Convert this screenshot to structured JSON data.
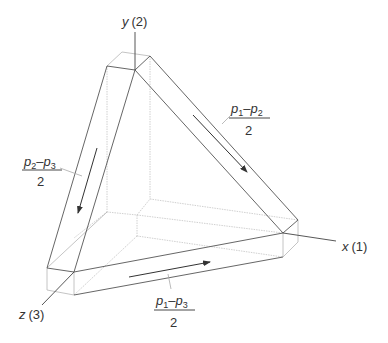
{
  "diagram": {
    "type": "stress-space prism (principal shear stresses)",
    "colors": {
      "edge_dark": "#555555",
      "edge_light": "#b8b8b8",
      "edge_hidden": "#c8c8c8",
      "text": "#333333",
      "background": "#ffffff"
    },
    "axes": [
      {
        "id": "y",
        "letter": "y",
        "index": "(2)"
      },
      {
        "id": "x",
        "letter": "x",
        "index": "(1)"
      },
      {
        "id": "z",
        "letter": "z",
        "index": "(3)"
      }
    ],
    "shear_labels": [
      {
        "id": "left",
        "num_a": "p",
        "sub_a": "2",
        "minus": "–",
        "num_b": "p",
        "sub_b": "3",
        "den": "2",
        "arrow_direction": "down"
      },
      {
        "id": "right",
        "num_a": "p",
        "sub_a": "1",
        "minus": "–",
        "num_b": "p",
        "sub_b": "2",
        "den": "2",
        "arrow_direction": "down-right"
      },
      {
        "id": "bottom",
        "num_a": "p",
        "sub_a": "1",
        "minus": "–",
        "num_b": "p",
        "sub_b": "3",
        "den": "2",
        "arrow_direction": "right"
      }
    ]
  }
}
